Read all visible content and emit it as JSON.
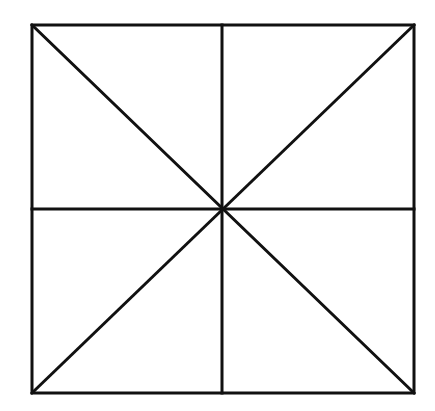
{
  "diagram": {
    "type": "square-with-diagonals-and-midlines",
    "stroke_color": "#111111",
    "background_color": "#ffffff",
    "square": {
      "left": 32,
      "top": 25,
      "right": 414,
      "bottom": 393
    },
    "center": {
      "x": 222,
      "y": 209
    },
    "lines": [
      {
        "id": "diagonal-tl-br",
        "x1": 32,
        "y1": 25,
        "x2": 414,
        "y2": 393
      },
      {
        "id": "diagonal-tr-bl",
        "x1": 414,
        "y1": 25,
        "x2": 32,
        "y2": 393
      },
      {
        "id": "vertical-midline",
        "x1": 222,
        "y1": 25,
        "x2": 222,
        "y2": 393
      },
      {
        "id": "horizontal-midline",
        "x1": 32,
        "y1": 209,
        "x2": 414,
        "y2": 209
      }
    ],
    "regions": 8
  }
}
